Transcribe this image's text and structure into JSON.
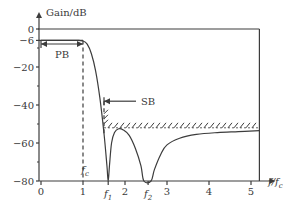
{
  "chart_data": {
    "type": "line",
    "title": "",
    "ylabel": "Gain/dB",
    "xlabel": "f/f_c",
    "xlabel_parts": [
      "f",
      "/",
      "f",
      "c"
    ],
    "xlim": [
      0,
      5.2
    ],
    "ylim": [
      -80,
      0
    ],
    "grid": false,
    "x_ticks": [
      {
        "value": 0,
        "label": "0"
      },
      {
        "value": 1,
        "label": "1"
      },
      {
        "value": 2,
        "label": "2"
      },
      {
        "value": 3,
        "label": "3"
      },
      {
        "value": 4,
        "label": "4"
      },
      {
        "value": 5,
        "label": "5"
      }
    ],
    "x_special_ticks": [
      {
        "value": 1,
        "label": "f",
        "sub": "c",
        "position": "above-axis"
      },
      {
        "value": 1.6,
        "label": "f",
        "sub": "1"
      },
      {
        "value": 2.55,
        "label": "f",
        "sub": "2"
      }
    ],
    "y_ticks": [
      {
        "value": 0,
        "label": "0"
      },
      {
        "value": -6,
        "label": "−6"
      },
      {
        "value": -20,
        "label": "−20"
      },
      {
        "value": -40,
        "label": "−40"
      },
      {
        "value": -60,
        "label": "−60"
      },
      {
        "value": -80,
        "label": "−80"
      }
    ],
    "y_minor_ticks": [
      -10,
      -30,
      -50,
      -70
    ],
    "series": [
      {
        "name": "frequency response",
        "points": [
          [
            0,
            -6
          ],
          [
            0.8,
            -6
          ],
          [
            1.0,
            -6.3
          ],
          [
            1.1,
            -8
          ],
          [
            1.2,
            -13
          ],
          [
            1.3,
            -22
          ],
          [
            1.4,
            -36
          ],
          [
            1.5,
            -55
          ],
          [
            1.57,
            -72
          ],
          [
            1.6,
            -80
          ],
          [
            1.63,
            -72
          ],
          [
            1.68,
            -60
          ],
          [
            1.75,
            -54.5
          ],
          [
            1.85,
            -52.5
          ],
          [
            1.95,
            -53
          ],
          [
            2.1,
            -56
          ],
          [
            2.25,
            -63
          ],
          [
            2.38,
            -72
          ],
          [
            2.45,
            -80
          ],
          [
            2.62,
            -80
          ],
          [
            2.7,
            -74
          ],
          [
            2.85,
            -66
          ],
          [
            3.0,
            -61
          ],
          [
            3.3,
            -57.5
          ],
          [
            3.7,
            -55.5
          ],
          [
            4.2,
            -54.5
          ],
          [
            4.7,
            -54
          ],
          [
            5.2,
            -53.5
          ]
        ]
      }
    ],
    "reference_lines": [
      {
        "name": "0 dB level",
        "y": 0,
        "x_range": [
          0,
          5.2
        ]
      },
      {
        "name": "-6 dB passband level",
        "y": -6,
        "x_range": [
          0,
          1.0
        ]
      },
      {
        "name": "cutoff marker",
        "x": 1,
        "y_range": [
          -80,
          -6
        ],
        "style": "dashed"
      },
      {
        "name": "stopband edge marker",
        "x": 1.5,
        "y_range": [
          -55,
          -38
        ],
        "style": "dashed"
      },
      {
        "name": "stopband limit",
        "y": -52,
        "x_range": [
          1.5,
          5.2
        ],
        "style": "hatched"
      }
    ],
    "annotations": [
      {
        "text": "PB",
        "meaning": "passband",
        "x_range": [
          0,
          1
        ],
        "y": -10
      },
      {
        "text": "SB",
        "meaning": "stopband",
        "arrow_to_x": 1.5,
        "y": -38
      }
    ]
  }
}
